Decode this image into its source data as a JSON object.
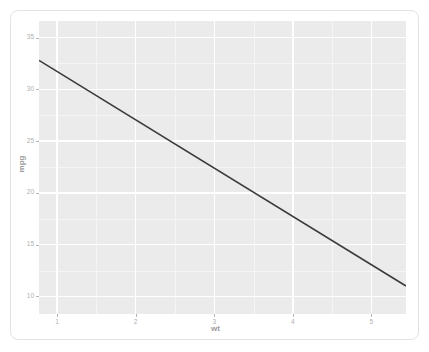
{
  "chart_data": {
    "type": "line",
    "title": "",
    "subtitle": "",
    "xlabel": "wt",
    "ylabel": "mpg",
    "xlim": [
      0.77,
      5.44
    ],
    "ylim": [
      8.3,
      36.6
    ],
    "x_ticks": [
      1,
      2,
      3,
      4,
      5
    ],
    "x_tick_labels": [
      "1",
      "2",
      "3",
      "4",
      "5"
    ],
    "y_ticks": [
      10,
      15,
      20,
      25,
      30,
      35
    ],
    "y_tick_labels": [
      "10",
      "15",
      "20",
      "25",
      "30",
      "35"
    ],
    "x_minor_ticks": [
      1.5,
      2.5,
      3.5,
      4.5
    ],
    "y_minor_ticks": [
      12.5,
      17.5,
      22.5,
      27.5,
      32.5
    ],
    "grid": true,
    "legend": false,
    "series": [
      {
        "name": "linear fit",
        "type": "line",
        "color": "#3b3b3b",
        "line_width": 1.6,
        "x": [
          0.77,
          5.44
        ],
        "y": [
          32.8,
          11.0
        ]
      }
    ],
    "annotations": [],
    "panel_background": "#ebebeb",
    "grid_color": "#ffffff",
    "axis_text_color": "#b0b0b0",
    "axis_title_color": "#9b9b9b",
    "card_background": "#ffffff"
  },
  "axes": {
    "x_title": "wt",
    "y_title": "mpg"
  },
  "ticks": {
    "y": [
      {
        "label": "35",
        "value": 35
      },
      {
        "label": "30",
        "value": 30
      },
      {
        "label": "25",
        "value": 25
      },
      {
        "label": "20",
        "value": 20
      },
      {
        "label": "15",
        "value": 15
      },
      {
        "label": "10",
        "value": 10
      }
    ],
    "x": [
      {
        "label": "1",
        "value": 1
      },
      {
        "label": "2",
        "value": 2
      },
      {
        "label": "3",
        "value": 3
      },
      {
        "label": "4",
        "value": 4
      },
      {
        "label": "5",
        "value": 5
      }
    ]
  }
}
